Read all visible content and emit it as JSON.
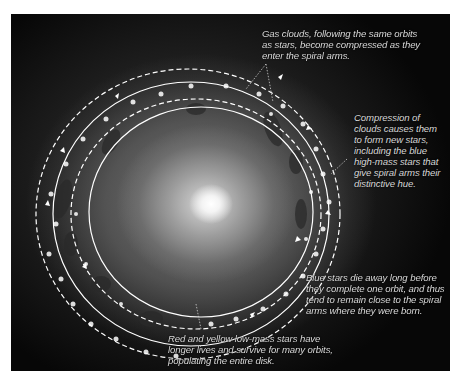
{
  "figure": {
    "colors": {
      "background": "#ffffff",
      "annotation_text": "#d8d8d8",
      "orbit_lines": "#ffffff"
    }
  },
  "annotations": [
    {
      "id": "gas-clouds",
      "lines": [
        "Gas clouds, following the same orbits",
        "as stars, become compressed as they",
        "enter the spiral arms."
      ]
    },
    {
      "id": "compression",
      "lines": [
        "Compression of",
        "clouds causes them",
        "to form new stars,",
        "including the blue",
        "high-mass stars that",
        "give spiral arms their",
        "distinctive hue."
      ]
    },
    {
      "id": "blue-stars",
      "lines": [
        "Blue stars die away long before",
        "they complete one orbit, and thus",
        "tend to remain close to the spiral",
        "arms where they were born."
      ]
    },
    {
      "id": "red-yellow-stars",
      "lines": [
        "Red and yellow low-mass stars have",
        "longer lives and survive for many orbits,",
        "populating the entire disk."
      ]
    }
  ]
}
